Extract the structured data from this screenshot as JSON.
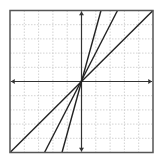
{
  "graph": {
    "frame": {
      "x0": 10,
      "y0": 10.5,
      "x1": 153,
      "y1": 152.5,
      "stroke": "#555555"
    },
    "grid": {
      "divisions": 10,
      "stroke": "#c8c8c8",
      "dash": "1.5,1.5"
    },
    "origin": {
      "px": 81.5,
      "py": 81.5
    },
    "axes": {
      "stroke": "#333333"
    },
    "lines": [
      {
        "name": "line-slope-1",
        "slope_approx": 1,
        "x1": 10,
        "y1": 152.5,
        "x2": 153,
        "y2": 10.5
      },
      {
        "name": "line-slope-2",
        "slope_approx": 2,
        "x1": 44.5,
        "y1": 152.5,
        "x2": 117.5,
        "y2": 10.5
      },
      {
        "name": "line-slope-steep",
        "slope_approx": 3.7,
        "x1": 62,
        "y1": 152.5,
        "x2": 101,
        "y2": 10.5
      }
    ],
    "line_stroke": "#222222"
  }
}
